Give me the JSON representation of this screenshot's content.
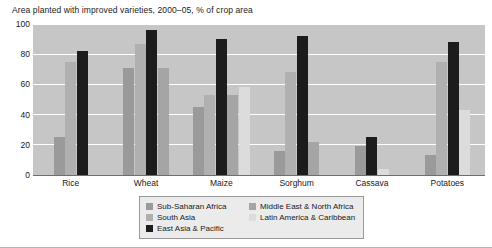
{
  "chart_data": {
    "type": "bar",
    "title": "Area planted with improved varieties, 2000–05, % of crop area",
    "xlabel": "",
    "ylabel": "",
    "ylim": [
      0,
      100
    ],
    "yticks": [
      0,
      20,
      40,
      60,
      80,
      100
    ],
    "grid": true,
    "legend_position": "bottom-center",
    "categories": [
      "Rice",
      "Wheat",
      "Maize",
      "Sorghum",
      "Cassava",
      "Potatoes"
    ],
    "series": [
      {
        "name": "Sub-Saharan Africa",
        "color": "#9a9a9a",
        "values": [
          25,
          71,
          45,
          16,
          19,
          13
        ]
      },
      {
        "name": "South Asia",
        "color": "#b0b0b0",
        "values": [
          75,
          87,
          53,
          68,
          null,
          75
        ]
      },
      {
        "name": "East Asia & Pacific",
        "color": "#1c1c1c",
        "values": [
          82,
          96,
          90,
          92,
          25,
          88
        ]
      },
      {
        "name": "Middle East & North Africa",
        "color": "#a5a5a5",
        "values": [
          null,
          71,
          53,
          22,
          null,
          null
        ]
      },
      {
        "name": "Latin America & Caribbean",
        "color": "#dcdcdc",
        "values": [
          null,
          null,
          58,
          null,
          4,
          43
        ]
      }
    ]
  },
  "legend": {
    "columns": [
      [
        "Sub-Saharan Africa",
        "South Asia",
        "East Asia & Pacific"
      ],
      [
        "Middle East & North Africa",
        "Latin America & Caribbean"
      ]
    ]
  },
  "colors": {
    "plot_background": "#c6c6c6",
    "gridline": "#ffffff",
    "axis": "#6e6e6e",
    "legend_background": "#ebebeb",
    "legend_border": "#9a9a9a",
    "text": "#1a1a1a"
  }
}
